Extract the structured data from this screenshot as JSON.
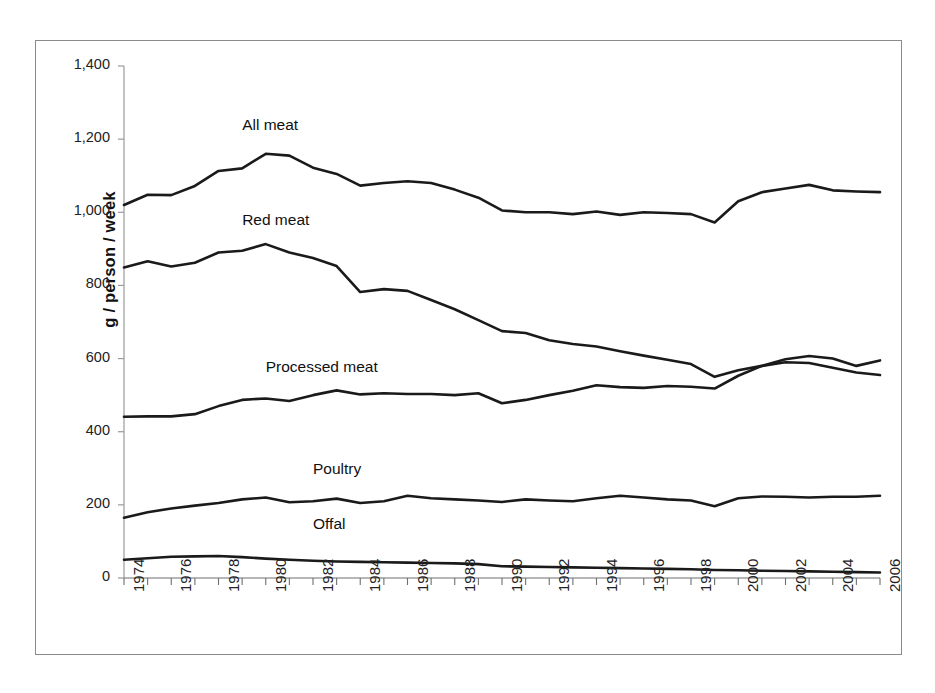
{
  "figure": {
    "axis_y_title": "g / person / week",
    "y_ticks": [
      "0",
      "200",
      "400",
      "600",
      "800",
      "1,000",
      "1,200",
      "1,400"
    ],
    "x_ticks": [
      "1974",
      "1976",
      "1978",
      "1980",
      "1982",
      "1984",
      "1986",
      "1988",
      "1990",
      "1992",
      "1994",
      "1996",
      "1998",
      "2000",
      "2002",
      "2004",
      "2006"
    ],
    "series_labels": {
      "all_meat": "All meat",
      "red_meat": "Red meat",
      "processed_meat": "Processed meat",
      "poultry": "Poultry",
      "offal": "Offal"
    },
    "line_color": "#1a1a1a",
    "frame_color": "#8a8a8a"
  },
  "chart_data": {
    "type": "line",
    "title": "",
    "xlabel": "",
    "ylabel": "g / person / week",
    "xlim": [
      1974,
      2006
    ],
    "ylim": [
      0,
      1400
    ],
    "ytick_step": 200,
    "grid": false,
    "legend": "inline-labels",
    "x": [
      1974,
      1975,
      1976,
      1977,
      1978,
      1979,
      1980,
      1981,
      1982,
      1983,
      1984,
      1985,
      1986,
      1987,
      1988,
      1989,
      1990,
      1991,
      1992,
      1993,
      1994,
      1995,
      1996,
      1997,
      1998,
      1999,
      2000,
      2001,
      2002,
      2003,
      2004,
      2005,
      2006
    ],
    "series": [
      {
        "name": "All meat",
        "values": [
          1020,
          1048,
          1047,
          1072,
          1113,
          1120,
          1160,
          1155,
          1122,
          1105,
          1073,
          1080,
          1085,
          1080,
          1062,
          1040,
          1005,
          1000,
          1000,
          995,
          1002,
          993,
          1000,
          998,
          995,
          972,
          1030,
          1055,
          1065,
          1075,
          1060,
          1057,
          1055
        ]
      },
      {
        "name": "Red meat",
        "values": [
          849,
          866,
          852,
          862,
          890,
          895,
          913,
          890,
          875,
          853,
          782,
          790,
          785,
          760,
          735,
          705,
          675,
          670,
          650,
          640,
          633,
          620,
          608,
          597,
          585,
          550,
          568,
          580,
          590,
          588,
          575,
          562,
          555
        ]
      },
      {
        "name": "Processed meat",
        "values": [
          441,
          442,
          442,
          448,
          470,
          487,
          491,
          484,
          500,
          513,
          502,
          505,
          503,
          503,
          500,
          505,
          478,
          487,
          500,
          512,
          527,
          522,
          520,
          525,
          523,
          518,
          553,
          580,
          598,
          607,
          600,
          580,
          595
        ]
      },
      {
        "name": "Poultry",
        "values": [
          165,
          180,
          190,
          198,
          205,
          215,
          220,
          207,
          210,
          217,
          205,
          210,
          225,
          218,
          215,
          212,
          208,
          215,
          212,
          210,
          218,
          225,
          220,
          215,
          212,
          196,
          218,
          223,
          222,
          220,
          222,
          222,
          225
        ]
      },
      {
        "name": "Offal",
        "values": [
          50,
          54,
          58,
          59,
          60,
          57,
          53,
          50,
          47,
          45,
          44,
          43,
          42,
          41,
          40,
          38,
          32,
          31,
          30,
          29,
          28,
          27,
          26,
          25,
          24,
          22,
          21,
          20,
          19,
          18,
          17,
          16,
          15
        ]
      }
    ],
    "series_label_positions": [
      {
        "name": "All meat",
        "x": 1979,
        "y": 1235
      },
      {
        "name": "Red meat",
        "x": 1979,
        "y": 975
      },
      {
        "name": "Processed meat",
        "x": 1980,
        "y": 575
      },
      {
        "name": "Poultry",
        "x": 1982,
        "y": 295
      },
      {
        "name": "Offal",
        "x": 1982,
        "y": 145
      }
    ]
  }
}
